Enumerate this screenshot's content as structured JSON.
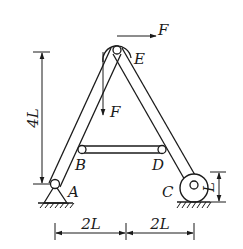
{
  "figure": {
    "type": "mechanics-diagram",
    "points": {
      "A": "A",
      "B": "B",
      "C": "C",
      "D": "D",
      "E": "E"
    },
    "forces": {
      "horizontal": "F",
      "vertical": "F"
    },
    "dimensions": {
      "height": "4L",
      "left_span": "2L",
      "right_span": "2L",
      "roller_radius": "L"
    },
    "icons": {
      "pin_support": "pin-support-icon",
      "roller_support": "roller-icon",
      "pulley": "pulley-icon",
      "ground": "ground-hatch-icon"
    }
  }
}
